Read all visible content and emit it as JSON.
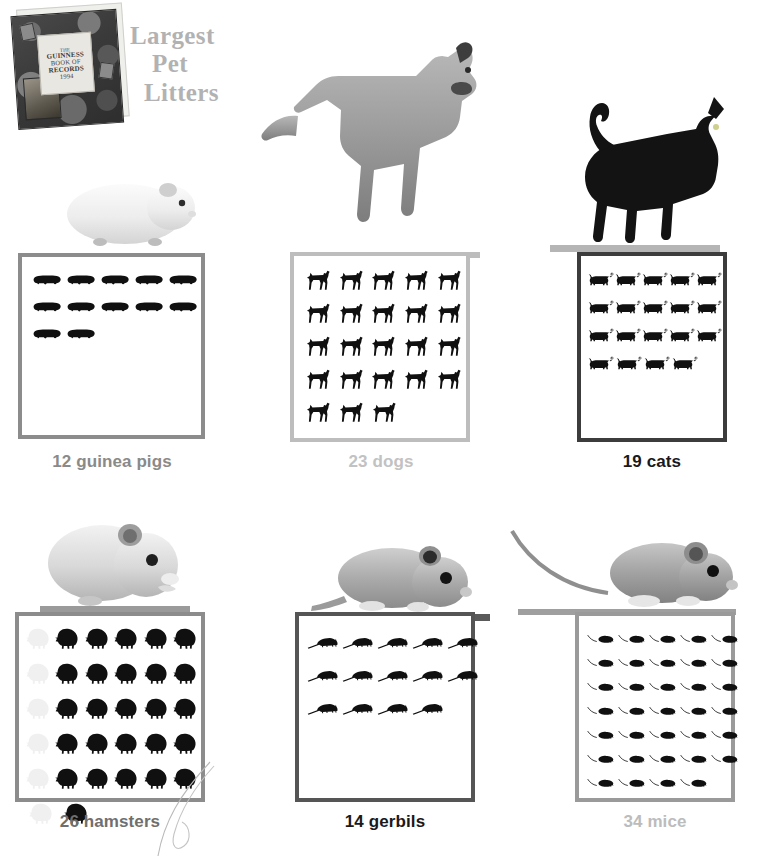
{
  "header": {
    "title_lines": [
      "Largest",
      "Pet",
      "Litters"
    ],
    "title_color": "#b2b2b2",
    "book": {
      "name": "guinness-book-of-records-1994",
      "cover_lines": [
        "THE",
        "GUINNESS",
        "BOOK OF",
        "RECORDS",
        "1994"
      ]
    }
  },
  "chart_data": {
    "type": "bar",
    "subtype": "pictogram",
    "title": "Largest Pet Litters",
    "source": "The Guinness Book of Records 1994",
    "xlabel": "",
    "ylabel": "Number of young in litter",
    "unit": "1 icon = 1 animal",
    "categories": [
      "guinea pigs",
      "dogs",
      "cats",
      "hamsters",
      "gerbils",
      "mice"
    ],
    "values": [
      12,
      23,
      19,
      26,
      14,
      34
    ],
    "ylim": [
      0,
      34
    ],
    "grid": false,
    "legend": "none",
    "series": [
      {
        "name": "litter size",
        "values": [
          12,
          23,
          19,
          26,
          14,
          34
        ]
      }
    ],
    "annotations": [
      "12 guinea pigs",
      "23 dogs",
      "19 cats",
      "26 hamsters",
      "14 gerbils",
      "34 mice"
    ]
  },
  "panels": [
    {
      "id": "guinea-pigs",
      "count": 12,
      "label": "12 guinea pigs",
      "label_color": "#8a8a8a",
      "border_color": "#8c8c8c",
      "icon": "guinea-pig-icon",
      "photo": "guinea-pig-photo",
      "columns": 5,
      "rows": [
        5,
        5,
        2
      ]
    },
    {
      "id": "dogs",
      "count": 23,
      "label": "23 dogs",
      "label_color": "#c2c2c2",
      "border_color": "#bdbdbd",
      "icon": "dog-icon",
      "photo": "great-dane-photo",
      "columns": 5,
      "rows": [
        5,
        5,
        5,
        5,
        3
      ]
    },
    {
      "id": "cats",
      "count": 19,
      "label": "19 cats",
      "label_color": "#1a1a1a",
      "border_color": "#3c3c3c",
      "icon": "cat-icon",
      "photo": "black-cat-photo",
      "columns": 5,
      "rows": [
        5,
        5,
        5,
        4
      ]
    },
    {
      "id": "hamsters",
      "count": 26,
      "label": "26 hamsters",
      "label_color": "#6f6f6f",
      "border_color": "#8c8c8c",
      "icon": "hamster-icon",
      "photo": "hamster-photo",
      "columns": 5,
      "rows": [
        5,
        5,
        5,
        5,
        5,
        1
      ],
      "ghost_column": true
    },
    {
      "id": "gerbils",
      "count": 14,
      "label": "14 gerbils",
      "label_color": "#1a1a1a",
      "border_color": "#555555",
      "icon": "gerbil-icon",
      "photo": "gerbil-photo",
      "columns": 5,
      "rows": [
        5,
        5,
        4
      ]
    },
    {
      "id": "mice",
      "count": 34,
      "label": "34 mice",
      "label_color": "#bcbcbc",
      "border_color": "#9a9a9a",
      "icon": "mouse-icon",
      "photo": "mouse-photo",
      "columns": 5,
      "rows": [
        5,
        5,
        5,
        5,
        5,
        5,
        4
      ]
    }
  ]
}
